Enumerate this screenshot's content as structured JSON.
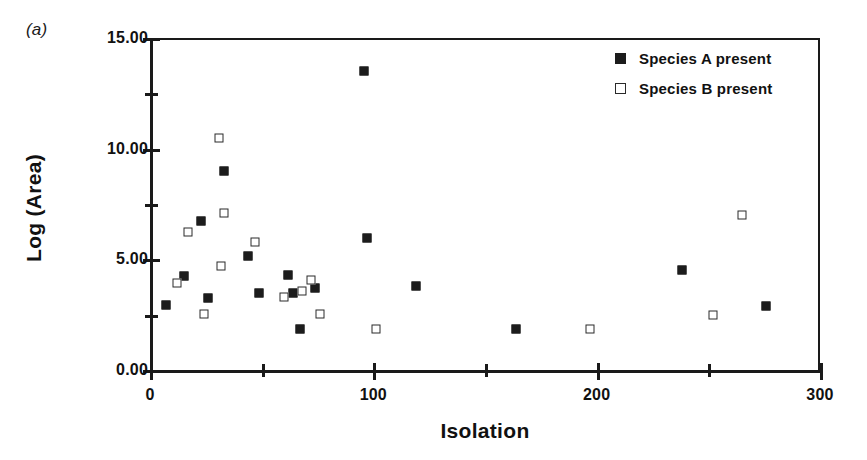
{
  "panel": {
    "label": "(a)"
  },
  "chart_data": {
    "type": "scatter",
    "title": "",
    "xlabel": "Isolation",
    "ylabel": "Log (Area)",
    "xlim": [
      0,
      300
    ],
    "ylim": [
      0,
      15
    ],
    "grid": false,
    "legend_position": "top-right",
    "x_ticks_major": [
      0,
      100,
      200,
      300
    ],
    "x_ticks_major_labels": [
      "0",
      "100",
      "200",
      "300"
    ],
    "x_ticks_minor": [
      50,
      150,
      250
    ],
    "y_ticks_major": [
      0,
      5,
      10,
      15
    ],
    "y_ticks_major_labels": [
      "0.00",
      "5.00",
      "10.00",
      "15.00"
    ],
    "y_ticks_minor": [
      2.5,
      7.5,
      12.5
    ],
    "series": [
      {
        "name": "Species A present",
        "marker": "filled-square",
        "color": "#1c1c1c",
        "points": [
          [
            7,
            2.95
          ],
          [
            15,
            4.25
          ],
          [
            23,
            6.75
          ],
          [
            26,
            3.25
          ],
          [
            33,
            9.0
          ],
          [
            44,
            5.15
          ],
          [
            49,
            3.5
          ],
          [
            62,
            4.3
          ],
          [
            64,
            3.5
          ],
          [
            67,
            1.85
          ],
          [
            74,
            3.7
          ],
          [
            96,
            13.5
          ],
          [
            97,
            5.95
          ],
          [
            119,
            3.8
          ],
          [
            164,
            1.85
          ],
          [
            238,
            4.5
          ],
          [
            276,
            2.9
          ]
        ]
      },
      {
        "name": "Species B present",
        "marker": "open-square",
        "color": "#ffffff",
        "points": [
          [
            12,
            3.95
          ],
          [
            17,
            6.25
          ],
          [
            24,
            2.55
          ],
          [
            31,
            10.5
          ],
          [
            32,
            4.7
          ],
          [
            33,
            7.1
          ],
          [
            47,
            5.8
          ],
          [
            60,
            3.3
          ],
          [
            68,
            3.55
          ],
          [
            72,
            4.05
          ],
          [
            76,
            2.55
          ],
          [
            101,
            1.85
          ],
          [
            197,
            1.85
          ],
          [
            252,
            2.5
          ],
          [
            265,
            7.0
          ]
        ]
      }
    ]
  },
  "legend": {
    "items": [
      {
        "label": "Species A present",
        "marker": "filled-square"
      },
      {
        "label": "Species B present",
        "marker": "open-square"
      }
    ]
  }
}
